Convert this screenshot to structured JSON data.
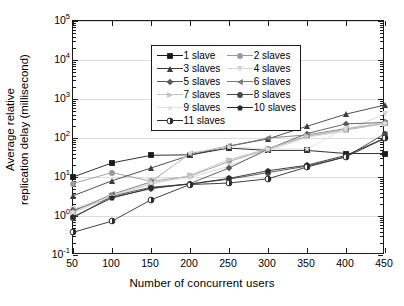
{
  "chart_data": {
    "type": "line",
    "title": "",
    "xlabel": "Number of concurrent users",
    "ylabel": "Average relative replication delay (millisecond)",
    "ylabel_lines": [
      "Average relative",
      "replication delay (millisecond)"
    ],
    "x": [
      50,
      100,
      150,
      200,
      250,
      300,
      350,
      400,
      450
    ],
    "xlim": [
      50,
      450
    ],
    "xticks": [
      50,
      100,
      150,
      200,
      250,
      300,
      350,
      400,
      450
    ],
    "xtick_labels": [
      "50",
      "100",
      "150",
      "200",
      "250",
      "300",
      "350",
      "400",
      "450"
    ],
    "yscale": "log",
    "ylim": [
      0.1,
      100000
    ],
    "yticks": [
      0.1,
      1,
      10,
      100,
      1000,
      10000,
      100000
    ],
    "ytick_labels": [
      "10-1",
      "100",
      "101",
      "102",
      "103",
      "104",
      "105"
    ],
    "ytick_mantissa": "10",
    "ytick_exponents": [
      "-1",
      "0",
      "1",
      "2",
      "3",
      "4",
      "5"
    ],
    "grid": "horizontal",
    "legend_position": "upper-left",
    "legend_columns": 2,
    "series": [
      {
        "name": "1 slave",
        "marker": "square",
        "color": "#1a1a1a",
        "values": [
          10.0,
          23.0,
          36.0,
          37.0,
          55.0,
          48.0,
          48.0,
          40.0,
          40.0
        ]
      },
      {
        "name": "2 slaves",
        "marker": "circle",
        "color": "#9a9a9a",
        "values": [
          6.8,
          13.0,
          7.8,
          10.5,
          25.0,
          52.0,
          110.0,
          160.0,
          240.0
        ]
      },
      {
        "name": "3 slaves",
        "marker": "triangle-up",
        "color": "#3d3d3d",
        "values": [
          3.3,
          8.0,
          17.0,
          36.0,
          62.0,
          95.0,
          200.0,
          410.0,
          700.0
        ]
      },
      {
        "name": "4 slaves",
        "marker": "triangle-down",
        "color": "#d6d6d6",
        "values": [
          1.5,
          3.4,
          7.2,
          9.6,
          19.0,
          46.0,
          105.0,
          150.0,
          420.0
        ]
      },
      {
        "name": "5 slaves",
        "marker": "diamond",
        "color": "#555555",
        "values": [
          1.4,
          3.0,
          5.0,
          6.8,
          17.0,
          52.0,
          130.0,
          230.0,
          250.0
        ]
      },
      {
        "name": "6 slaves",
        "marker": "triangle-left",
        "color": "#7a7a7a",
        "values": [
          1.3,
          3.6,
          7.5,
          40.0,
          62.0,
          100.0,
          120.0,
          175.0,
          245.0
        ]
      },
      {
        "name": "7 slaves",
        "marker": "triangle-right",
        "color": "#c4c4c4",
        "values": [
          1.2,
          3.2,
          6.6,
          11.0,
          28.0,
          53.0,
          115.0,
          165.0,
          230.0
        ]
      },
      {
        "name": "8 slaves",
        "marker": "circle",
        "color": "#4a4a4a",
        "values": [
          0.9,
          3.2,
          5.5,
          6.6,
          8.8,
          13.0,
          19.0,
          33.0,
          130.0
        ]
      },
      {
        "name": "9 slaves",
        "marker": "star",
        "color": "#e0e0e0",
        "values": [
          1.25,
          3.3,
          7.0,
          42.0,
          60.0,
          53.0,
          52.0,
          180.0,
          245.0
        ]
      },
      {
        "name": "10 slaves",
        "marker": "pentagon",
        "color": "#2b2b2b",
        "values": [
          0.95,
          2.9,
          5.2,
          6.6,
          9.2,
          14.5,
          20.0,
          36.0,
          100.0
        ]
      },
      {
        "name": "11 slaves",
        "marker": "half-circle",
        "color": "#2b2b2b",
        "values": [
          0.38,
          0.74,
          2.6,
          6.4,
          7.0,
          9.0,
          18.0,
          33.0,
          98.0
        ]
      }
    ]
  },
  "legend": {
    "entries": [
      {
        "label": "1 slave"
      },
      {
        "label": "2 slaves"
      },
      {
        "label": "3 slaves"
      },
      {
        "label": "4 slaves"
      },
      {
        "label": "5 slaves"
      },
      {
        "label": "6 slaves"
      },
      {
        "label": "7 slaves"
      },
      {
        "label": "8 slaves"
      },
      {
        "label": "9 slaves"
      },
      {
        "label": "10 slaves"
      },
      {
        "label": "11 slaves"
      }
    ]
  },
  "colors": {
    "axis": "#1a1a1a",
    "grid": "#dcdcdc",
    "background": "#ffffff"
  }
}
